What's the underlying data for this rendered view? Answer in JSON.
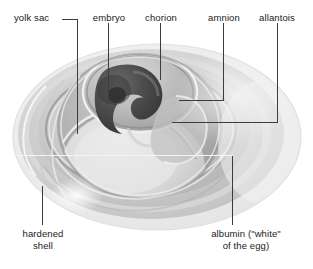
{
  "figure": {
    "width": 313,
    "height": 269,
    "background": "#ffffff"
  },
  "labels": {
    "yolk_sac": "yolk sac",
    "embryo": "embryo",
    "chorion": "chorion",
    "amnion": "amnion",
    "allantois": "allantois",
    "hardened_shell_line1": "hardened",
    "hardened_shell_line2": "shell",
    "albumin_line1": "albumin (\"white\"",
    "albumin_line2": "of the egg)"
  },
  "colors": {
    "text": "#1a1a1a",
    "leader_line": "#3c3c3c",
    "leader_line_light": "#f2f2f2",
    "shell_outer": "#e9e9e9",
    "shell_mid": "#d6d6d6",
    "albumin": "#c9c9c9",
    "albumin_light": "#dcdcdc",
    "yolk": "#b6b6b6",
    "yolk_light": "#cfcfcf",
    "embryo_dark": "#4a4a4a",
    "embryo_darkest": "#2e2e2e",
    "amnion_ring": "#8f8f8f",
    "highlight": "#f4f4f4"
  },
  "parts": [
    {
      "name": "yolk sac",
      "leader_x": 77,
      "leader_top": 22,
      "leader_bottom": 133
    },
    {
      "name": "embryo",
      "leader_x": 108,
      "leader_top": 22,
      "leader_bottom": 100
    },
    {
      "name": "chorion",
      "leader_x": 160,
      "leader_top": 22,
      "leader_bottom": 79
    },
    {
      "name": "amnion",
      "leader_x": 223,
      "leader_top": 22,
      "leader_bottom": 100
    },
    {
      "name": "allantois",
      "leader_x": 277,
      "leader_top": 22,
      "leader_bottom": 122
    },
    {
      "name": "hardened shell",
      "leader_x": 42,
      "leader_top": 185,
      "leader_bottom": 224
    },
    {
      "name": "albumin",
      "leader_x": 232,
      "leader_top": 156,
      "leader_bottom": 224
    }
  ]
}
